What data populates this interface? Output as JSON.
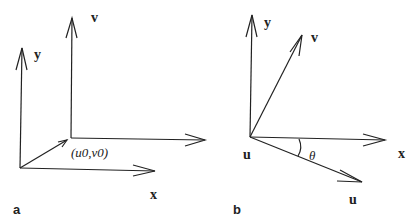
{
  "panel_a": {
    "panel_label": "a",
    "axis_y": "y",
    "axis_x": "x",
    "axis_v": "v",
    "origin_label": "(u0,v0)"
  },
  "panel_b": {
    "panel_label": "b",
    "axis_y": "y",
    "axis_x": "x",
    "axis_v": "v",
    "axis_u": "u",
    "origin_label": "u",
    "angle_label": "θ"
  },
  "colors": {
    "stroke": "#222222",
    "background": "#ffffff"
  }
}
